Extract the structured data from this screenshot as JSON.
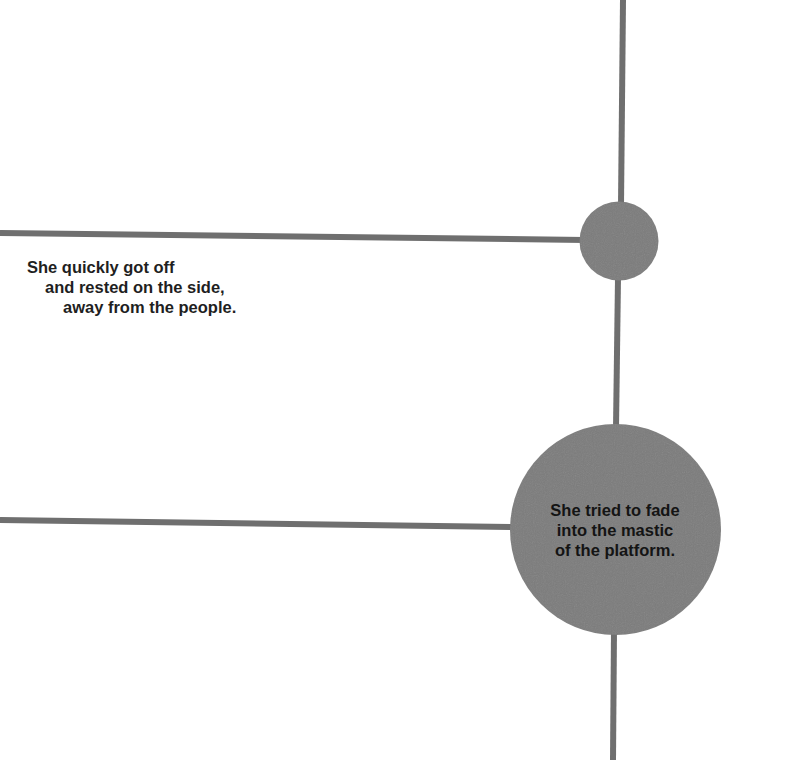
{
  "colors": {
    "background": "#ffffff",
    "line": "#6f6f6f",
    "node_fill": "#7b7b7b",
    "text": "#1f1f1f"
  },
  "diagram": {
    "vertical_timeline": {
      "segments": [
        {
          "x1": 623,
          "y1": 0,
          "x2": 621,
          "y2": 202
        },
        {
          "x1": 618,
          "y1": 281,
          "x2": 616,
          "y2": 425
        },
        {
          "x1": 614,
          "y1": 634,
          "x2": 613,
          "y2": 760
        }
      ]
    },
    "branches": [
      {
        "name": "branch-1",
        "x1": 0,
        "y1": 233,
        "x2": 582,
        "y2": 240
      },
      {
        "name": "branch-2",
        "x1": 0,
        "y1": 520,
        "x2": 512,
        "y2": 527
      }
    ],
    "nodes": [
      {
        "name": "node-small",
        "cx": 619,
        "cy": 241,
        "r": 39.5
      },
      {
        "name": "node-large",
        "cx": 615.5,
        "cy": 529.5,
        "r": 105.5
      }
    ]
  },
  "captions": {
    "left": {
      "lines": [
        "She quickly got off",
        "and rested on the side,",
        "away from the people."
      ]
    },
    "circle": {
      "lines": [
        "She tried to fade",
        "into the mastic",
        "of the platform."
      ]
    }
  }
}
